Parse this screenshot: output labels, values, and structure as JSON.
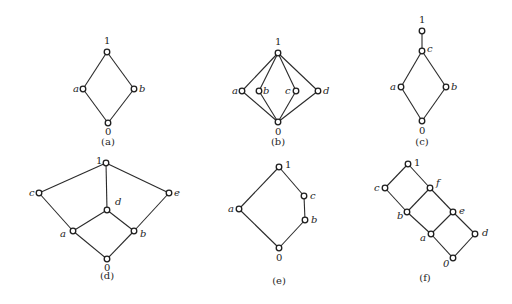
{
  "colors": {
    "line": "#2a2a2a",
    "node_fill": "#ffffff",
    "node_stroke": "#1e1e1e",
    "background": "#ffffff"
  },
  "diagrams": [
    {
      "caption": "(a)",
      "caption_pos": [
        108,
        145
      ],
      "nodes": [
        {
          "id": "1",
          "label": "1",
          "x": 107,
          "y": 52,
          "lx": 104,
          "ly": 44,
          "italic": false
        },
        {
          "id": "a",
          "label": "a",
          "x": 83,
          "y": 89,
          "lx": 73,
          "ly": 92,
          "italic": true
        },
        {
          "id": "b",
          "label": "b",
          "x": 134,
          "y": 89,
          "lx": 139,
          "ly": 92,
          "italic": true
        },
        {
          "id": "0",
          "label": "0",
          "x": 108,
          "y": 123,
          "lx": 105,
          "ly": 135,
          "italic": false
        }
      ],
      "edges": [
        [
          "1",
          "a"
        ],
        [
          "1",
          "b"
        ],
        [
          "a",
          "0"
        ],
        [
          "b",
          "0"
        ]
      ]
    },
    {
      "caption": "(b)",
      "caption_pos": [
        278,
        145
      ],
      "nodes": [
        {
          "id": "1",
          "label": "1",
          "x": 278,
          "y": 53,
          "lx": 275,
          "ly": 45,
          "italic": false
        },
        {
          "id": "a",
          "label": "a",
          "x": 242,
          "y": 91,
          "lx": 232,
          "ly": 94,
          "italic": true
        },
        {
          "id": "b",
          "label": "b",
          "x": 259,
          "y": 91,
          "lx": 263,
          "ly": 94,
          "italic": true
        },
        {
          "id": "c",
          "label": "c",
          "x": 296,
          "y": 91,
          "lx": 285,
          "ly": 94,
          "italic": true
        },
        {
          "id": "d",
          "label": "d",
          "x": 318,
          "y": 91,
          "lx": 323,
          "ly": 94,
          "italic": true
        },
        {
          "id": "0",
          "label": "0",
          "x": 278,
          "y": 122,
          "lx": 275,
          "ly": 135,
          "italic": false
        }
      ],
      "edges": [
        [
          "1",
          "a"
        ],
        [
          "1",
          "b"
        ],
        [
          "1",
          "c"
        ],
        [
          "1",
          "d"
        ],
        [
          "a",
          "0"
        ],
        [
          "b",
          "0"
        ],
        [
          "c",
          "0"
        ],
        [
          "d",
          "0"
        ]
      ]
    },
    {
      "caption": "(c)",
      "caption_pos": [
        422,
        145
      ],
      "nodes": [
        {
          "id": "1",
          "label": "1",
          "x": 422,
          "y": 31,
          "lx": 419,
          "ly": 23,
          "italic": false
        },
        {
          "id": "c",
          "label": "c",
          "x": 422,
          "y": 51,
          "lx": 427,
          "ly": 52,
          "italic": true
        },
        {
          "id": "a",
          "label": "a",
          "x": 401,
          "y": 87,
          "lx": 390,
          "ly": 90,
          "italic": true
        },
        {
          "id": "b",
          "label": "b",
          "x": 446,
          "y": 87,
          "lx": 451,
          "ly": 90,
          "italic": true
        },
        {
          "id": "0",
          "label": "0",
          "x": 422,
          "y": 121,
          "lx": 419,
          "ly": 134,
          "italic": false
        }
      ],
      "edges": [
        [
          "1",
          "c"
        ],
        [
          "c",
          "a"
        ],
        [
          "c",
          "b"
        ],
        [
          "a",
          "0"
        ],
        [
          "b",
          "0"
        ]
      ]
    },
    {
      "caption": "(d)",
      "caption_pos": [
        107,
        279
      ],
      "nodes": [
        {
          "id": "1",
          "label": "1",
          "x": 106,
          "y": 163,
          "lx": 96,
          "ly": 164,
          "italic": false
        },
        {
          "id": "c",
          "label": "c",
          "x": 39,
          "y": 193,
          "lx": 29,
          "ly": 196,
          "italic": true
        },
        {
          "id": "e",
          "label": "e",
          "x": 169,
          "y": 193,
          "lx": 174,
          "ly": 196,
          "italic": true
        },
        {
          "id": "d",
          "label": "d",
          "x": 107,
          "y": 210,
          "lx": 115,
          "ly": 205,
          "italic": true
        },
        {
          "id": "a",
          "label": "a",
          "x": 73,
          "y": 231,
          "lx": 60,
          "ly": 237,
          "italic": true
        },
        {
          "id": "b",
          "label": "b",
          "x": 134,
          "y": 231,
          "lx": 140,
          "ly": 237,
          "italic": true
        },
        {
          "id": "0",
          "label": "0",
          "x": 107,
          "y": 259,
          "lx": 104,
          "ly": 271,
          "italic": false
        }
      ],
      "edges": [
        [
          "1",
          "c"
        ],
        [
          "1",
          "e"
        ],
        [
          "1",
          "d"
        ],
        [
          "c",
          "a"
        ],
        [
          "e",
          "b"
        ],
        [
          "d",
          "a"
        ],
        [
          "d",
          "b"
        ],
        [
          "a",
          "0"
        ],
        [
          "b",
          "0"
        ]
      ]
    },
    {
      "caption": "(e)",
      "caption_pos": [
        279,
        284
      ],
      "nodes": [
        {
          "id": "1",
          "label": "1",
          "x": 279,
          "y": 167,
          "lx": 285,
          "ly": 168,
          "italic": false
        },
        {
          "id": "c",
          "label": "c",
          "x": 304,
          "y": 196,
          "lx": 310,
          "ly": 199,
          "italic": true
        },
        {
          "id": "b",
          "label": "b",
          "x": 305,
          "y": 220,
          "lx": 311,
          "ly": 223,
          "italic": true
        },
        {
          "id": "a",
          "label": "a",
          "x": 239,
          "y": 209,
          "lx": 228,
          "ly": 212,
          "italic": true
        },
        {
          "id": "0",
          "label": "0",
          "x": 279,
          "y": 248,
          "lx": 276,
          "ly": 261,
          "italic": false
        }
      ],
      "edges": [
        [
          "1",
          "c"
        ],
        [
          "c",
          "b"
        ],
        [
          "b",
          "0"
        ],
        [
          "1",
          "a"
        ],
        [
          "a",
          "0"
        ]
      ]
    },
    {
      "caption": "(f)",
      "caption_pos": [
        425,
        281
      ],
      "nodes": [
        {
          "id": "1",
          "label": "1",
          "x": 408,
          "y": 164,
          "lx": 414,
          "ly": 166,
          "italic": false
        },
        {
          "id": "c",
          "label": "c",
          "x": 385,
          "y": 188,
          "lx": 374,
          "ly": 191,
          "italic": true
        },
        {
          "id": "f",
          "label": "f",
          "x": 430,
          "y": 188,
          "lx": 436,
          "ly": 186,
          "italic": true
        },
        {
          "id": "b",
          "label": "b",
          "x": 407,
          "y": 212,
          "lx": 397,
          "ly": 219,
          "italic": true
        },
        {
          "id": "e",
          "label": "e",
          "x": 453,
          "y": 212,
          "lx": 459,
          "ly": 214,
          "italic": true
        },
        {
          "id": "a",
          "label": "a",
          "x": 431,
          "y": 234,
          "lx": 420,
          "ly": 241,
          "italic": true
        },
        {
          "id": "d",
          "label": "d",
          "x": 475,
          "y": 234,
          "lx": 482,
          "ly": 236,
          "italic": true
        },
        {
          "id": "0",
          "label": "0",
          "x": 453,
          "y": 258,
          "lx": 443,
          "ly": 267,
          "italic": true
        }
      ],
      "edges": [
        [
          "1",
          "c"
        ],
        [
          "1",
          "f"
        ],
        [
          "c",
          "b"
        ],
        [
          "f",
          "b"
        ],
        [
          "f",
          "e"
        ],
        [
          "b",
          "a"
        ],
        [
          "e",
          "a"
        ],
        [
          "e",
          "d"
        ],
        [
          "a",
          "0"
        ],
        [
          "d",
          "0"
        ]
      ]
    }
  ]
}
